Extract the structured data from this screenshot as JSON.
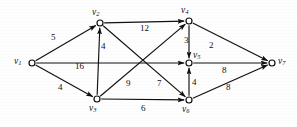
{
  "figure": {
    "name": "weighted-directed-graph",
    "width": 297,
    "height": 127,
    "background_color": "#fefefe",
    "stroke_color": "#101010"
  },
  "chart_data": {
    "type": "diagram",
    "diagram_type": "directed-weighted-graph",
    "title": "",
    "xlabel": "",
    "ylabel": "",
    "directed": true,
    "nodes": [
      {
        "id": "v1",
        "label": "v",
        "subscript": "1",
        "x": 32,
        "y": 63,
        "label_x": 14,
        "label_y": 57
      },
      {
        "id": "v2",
        "label": "v",
        "subscript": "2",
        "x": 100,
        "y": 23,
        "label_x": 92,
        "label_y": 8
      },
      {
        "id": "v3",
        "label": "v",
        "subscript": "3",
        "x": 97,
        "y": 99,
        "label_x": 89,
        "label_y": 104
      },
      {
        "id": "v4",
        "label": "v",
        "subscript": "4",
        "x": 189,
        "y": 21,
        "label_x": 181,
        "label_y": 6
      },
      {
        "id": "v5",
        "label": "v",
        "subscript": "5",
        "x": 189,
        "y": 63,
        "label_x": 193,
        "label_y": 51
      },
      {
        "id": "v6",
        "label": "v",
        "subscript": "6",
        "x": 189,
        "y": 100,
        "label_x": 182,
        "label_y": 105
      },
      {
        "id": "v7",
        "label": "v",
        "subscript": "7",
        "x": 272,
        "y": 63,
        "label_x": 278,
        "label_y": 57
      }
    ],
    "edges": [
      {
        "from": "v1",
        "to": "v2",
        "weight": 5,
        "label_x": 51,
        "label_y": 33
      },
      {
        "from": "v1",
        "to": "v3",
        "weight": 4,
        "label_x": 58,
        "label_y": 83
      },
      {
        "from": "v1",
        "to": "v5",
        "weight": 16,
        "label_x": 75,
        "label_y": 62
      },
      {
        "from": "v3",
        "to": "v2",
        "weight": 4,
        "label_x": 101,
        "label_y": 42
      },
      {
        "from": "v2",
        "to": "v4",
        "weight": 12,
        "label_x": 140,
        "label_y": 24
      },
      {
        "from": "v2",
        "to": "v6",
        "weight": 7,
        "label_x": 157,
        "label_y": 79
      },
      {
        "from": "v3",
        "to": "v4",
        "weight": 9,
        "label_x": 126,
        "label_y": 79
      },
      {
        "from": "v3",
        "to": "v6",
        "weight": 6,
        "label_x": 141,
        "label_y": 104
      },
      {
        "from": "v4",
        "to": "v5",
        "weight": 3,
        "label_x": 184,
        "label_y": 36
      },
      {
        "from": "v4",
        "to": "v7",
        "weight": 2,
        "label_x": 209,
        "label_y": 41
      },
      {
        "from": "v6",
        "to": "v5",
        "weight": 4,
        "label_x": 192,
        "label_y": 78
      },
      {
        "from": "v5",
        "to": "v7",
        "weight": 8,
        "label_x": 222,
        "label_y": 66
      },
      {
        "from": "v6",
        "to": "v7",
        "weight": 8,
        "label_x": 226,
        "label_y": 83
      }
    ],
    "node_radius": 3,
    "legend": null,
    "grid": false
  }
}
